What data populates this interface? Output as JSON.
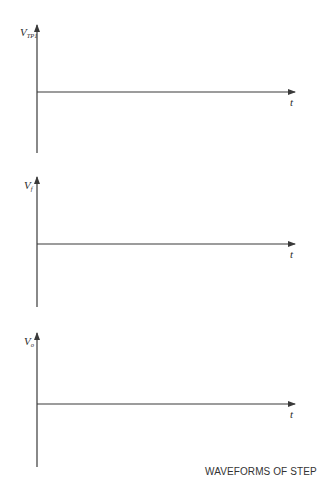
{
  "figure": {
    "caption": "WAVEFORMS OF STEP 6",
    "line_color": "#3a3a3a",
    "plots": [
      {
        "y_label_main": "V",
        "y_label_sub": "TP1",
        "x_label": "t"
      },
      {
        "y_label_main": "V",
        "y_label_sub": "f",
        "x_label": "t"
      },
      {
        "y_label_main": "V",
        "y_label_sub": "o",
        "x_label": "t"
      }
    ]
  }
}
